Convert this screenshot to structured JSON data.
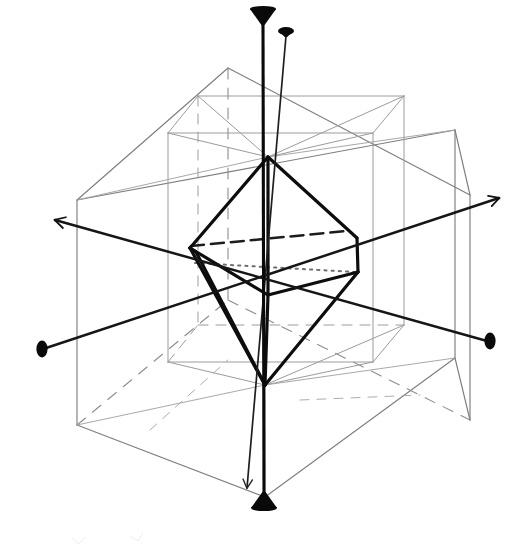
{
  "figure": {
    "title": "Symmetry axes of a cubic (isometric) crystal form",
    "domain": "line-diagram",
    "background_color": "#ffffff",
    "ink_color": "#000000",
    "faint_line_color": "#8a8a8a",
    "medium_line_color": "#585858",
    "canvas": {
      "width": 526,
      "height": 560
    }
  },
  "geometry": {
    "outer_box": {
      "name": "outer-wireframe-box",
      "stroke": "#7e7e7e",
      "stroke_width": 1.1,
      "vertices": {
        "front_top_left": [
          77,
          200
        ],
        "front_top_right": [
          455,
          130
        ],
        "front_bottom_left": [
          77,
          425
        ],
        "front_bottom_right": [
          455,
          358
        ],
        "back_top_left": [
          228,
          68
        ],
        "back_top_right": [
          470,
          195
        ],
        "back_bottom_left": [
          228,
          300
        ],
        "back_bottom_right": [
          470,
          420
        ],
        "near_bottom_front": [
          265,
          497
        ]
      }
    },
    "inner_box": {
      "name": "inner-wireframe-box",
      "stroke": "#9a9a9a",
      "stroke_width": 1.0,
      "vertices": {
        "front_top_left": [
          168,
          133
        ],
        "front_top_right": [
          373,
          133
        ],
        "front_bottom_left": [
          168,
          362
        ],
        "front_bottom_right": [
          373,
          362
        ],
        "back_top_left": [
          198,
          96
        ],
        "back_top_right": [
          404,
          96
        ],
        "back_bottom_left": [
          198,
          325
        ],
        "back_bottom_right": [
          404,
          325
        ]
      }
    },
    "octahedron": {
      "name": "inscribed-octahedron",
      "stroke": "#0d0d0d",
      "stroke_width": 3.2,
      "apex_top": [
        268,
        157
      ],
      "apex_bottom": [
        265,
        385
      ],
      "equator": [
        {
          "label": "left",
          "point": [
            190,
            248
          ]
        },
        {
          "label": "front",
          "point": [
            268,
            295
          ]
        },
        {
          "label": "right",
          "point": [
            357,
            268
          ]
        },
        {
          "label": "back_hidden",
          "point": [
            283,
            222
          ]
        }
      ],
      "hidden_edges": [
        {
          "style": "dashed",
          "from": [
            190,
            245
          ],
          "to": [
            345,
            232
          ]
        },
        {
          "style": "dotted",
          "from": [
            193,
            262
          ],
          "to": [
            353,
            271
          ]
        }
      ]
    },
    "axes": [
      {
        "name": "vertical-4fold-axis",
        "label": "vertical axis",
        "stroke": "#000000",
        "stroke_width": 3.0,
        "from": [
          263,
          30
        ],
        "to": [
          264,
          500
        ],
        "terminator_start": "solid-cone-up",
        "terminator_end": "solid-cone-down"
      },
      {
        "name": "secondary-vertical-axis",
        "label": "secondary near-vertical axis",
        "stroke": "#1a1a1a",
        "stroke_width": 1.6,
        "from": [
          286,
          33
        ],
        "to": [
          247,
          497
        ],
        "terminator_start": "small-solid-knob",
        "terminator_end": "open-stroke-arrow"
      },
      {
        "name": "axis-upper-left-to-lower-right",
        "label": "inclined axis, upper-left to lower-right",
        "stroke": "#1a1a1a",
        "stroke_width": 2.4,
        "from": [
          47,
          218
        ],
        "to": [
          490,
          341
        ],
        "terminator_start": "open-stroke-arrow",
        "terminator_end": "solid-knob"
      },
      {
        "name": "axis-lower-left-to-upper-right",
        "label": "inclined axis, lower-left to upper-right",
        "stroke": "#1a1a1a",
        "stroke_width": 2.4,
        "from": [
          43,
          349
        ],
        "to": [
          503,
          196
        ],
        "terminator_start": "solid-knob",
        "terminator_end": "open-stroke-arrow"
      }
    ],
    "terminators": [
      {
        "name": "cone-arrowhead-top",
        "kind": "solid-cone",
        "at": [
          263,
          22
        ],
        "points_toward": "up"
      },
      {
        "name": "cone-arrowhead-bottom",
        "kind": "solid-cone",
        "at": [
          264,
          500
        ],
        "points_toward": "down"
      },
      {
        "name": "knob-top-right",
        "kind": "solid-knob",
        "at": [
          287,
          30
        ]
      },
      {
        "name": "knob-left",
        "kind": "solid-knob",
        "at": [
          42,
          349
        ]
      },
      {
        "name": "knob-right",
        "kind": "solid-knob",
        "at": [
          490,
          341
        ]
      },
      {
        "name": "open-arrow-upper-left",
        "kind": "open-arrow",
        "at": [
          48,
          217
        ],
        "points_toward": "upper-left"
      },
      {
        "name": "open-arrow-upper-right",
        "kind": "open-arrow",
        "at": [
          503,
          196
        ],
        "points_toward": "upper-right"
      },
      {
        "name": "open-arrow-bottom",
        "kind": "open-arrow",
        "at": [
          247,
          493
        ],
        "points_toward": "down"
      }
    ]
  }
}
